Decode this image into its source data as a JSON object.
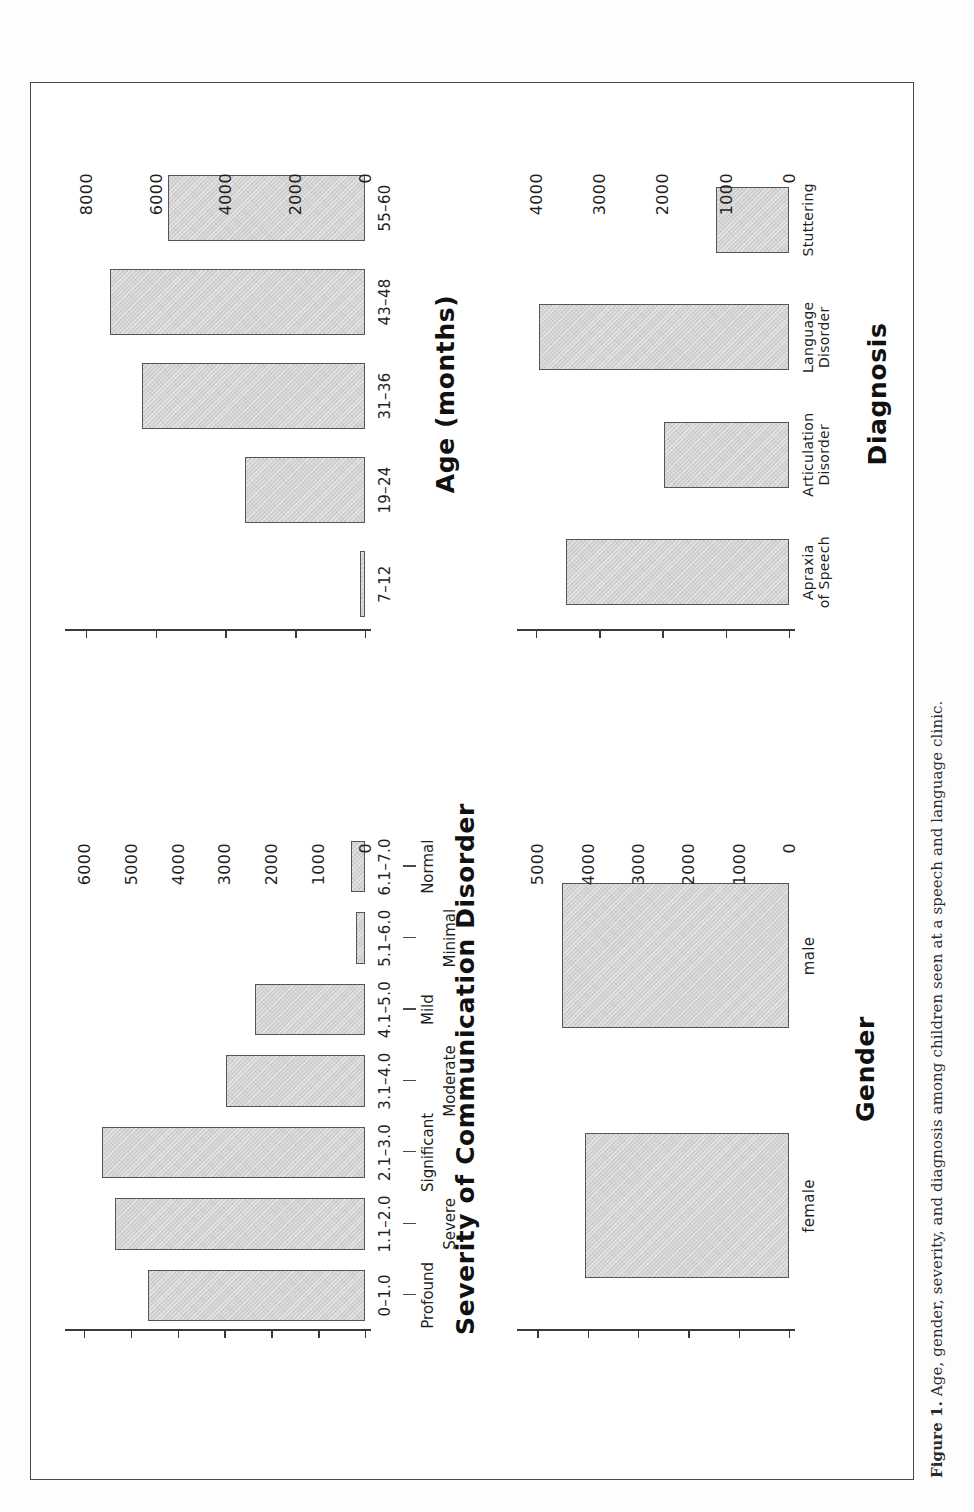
{
  "caption": {
    "label": "Figure 1.",
    "text": "Age, gender, severity, and diagnosis among children seen at a speech and language clinic."
  },
  "chart_data": [
    {
      "id": "age",
      "type": "bar",
      "title": "Age (months)",
      "xlabel": "Age (months)",
      "ylabel": "",
      "categories": [
        "7–12",
        "19–24",
        "31–36",
        "43–48",
        "55–60"
      ],
      "values": [
        150,
        3450,
        6400,
        7300,
        5640
      ],
      "ylim": [
        0,
        8600
      ],
      "yticks": [
        0,
        2000,
        4000,
        6000,
        8000
      ],
      "yticklabels": [
        "0",
        "2000",
        "4000",
        "6000",
        "8000"
      ],
      "grid": false,
      "legend": "none"
    },
    {
      "id": "diagnosis",
      "type": "bar",
      "title": "Diagnosis",
      "xlabel": "Diagnosis",
      "ylabel": "",
      "categories": [
        "Apraxia\nof Speech",
        "Articulation\nDisorder",
        "Language\nDisorder",
        "Stuttering"
      ],
      "values": [
        3520,
        1980,
        3960,
        1150
      ],
      "ylim": [
        0,
        4300
      ],
      "yticks": [
        0,
        1000,
        2000,
        3000,
        4000
      ],
      "yticklabels": [
        "0",
        "1000",
        "2000",
        "3000",
        "4000"
      ],
      "grid": false,
      "legend": "none"
    },
    {
      "id": "severity",
      "type": "bar",
      "title": "Severity of Communication Disorder",
      "xlabel": "Severity of Communication Disorder",
      "ylabel": "",
      "categories": [
        "0–1.0",
        "1.1–2.0",
        "2.1–3.0",
        "3.1–4.0",
        "4.1–5.0",
        "5.1–6.0",
        "6.1–7.0"
      ],
      "category_words": [
        "Profound",
        "Severe",
        "Significant",
        "Moderate",
        "Mild",
        "Minimal",
        "Normal"
      ],
      "values": [
        4620,
        5330,
        5620,
        2970,
        2350,
        190,
        300
      ],
      "ylim": [
        0,
        6400
      ],
      "yticks": [
        0,
        1000,
        2000,
        3000,
        4000,
        5000,
        6000
      ],
      "yticklabels": [
        "0",
        "1000",
        "2000",
        "3000",
        "4000",
        "5000",
        "6000"
      ],
      "grid": false,
      "legend": "none"
    },
    {
      "id": "gender",
      "type": "bar",
      "title": "Gender",
      "xlabel": "Gender",
      "ylabel": "",
      "categories": [
        "female",
        "male"
      ],
      "values": [
        4050,
        4500
      ],
      "ylim": [
        0,
        5400
      ],
      "yticks": [
        0,
        1000,
        2000,
        3000,
        4000,
        5000
      ],
      "yticklabels": [
        "0",
        "1000",
        "2000",
        "3000",
        "4000",
        "5000"
      ],
      "grid": false,
      "legend": "none"
    }
  ]
}
